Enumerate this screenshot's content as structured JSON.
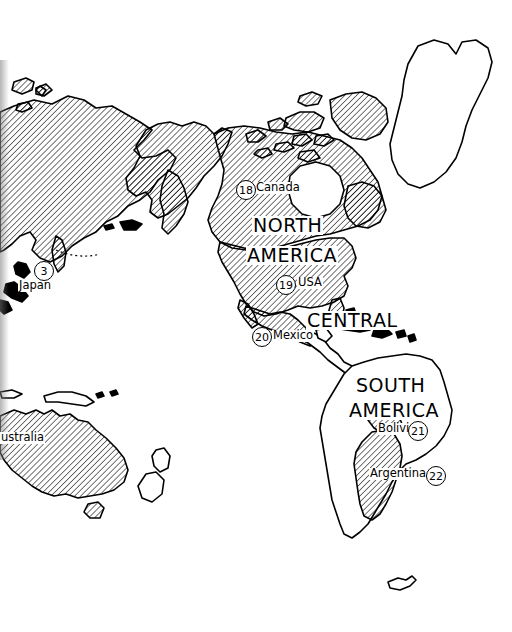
{
  "map": {
    "title": "World Map - Americas",
    "projection_note": "Pacific-centered world map, Americas region",
    "style": {
      "background": "#ffffff",
      "line_color": "#000000",
      "hatch_color": "#000000",
      "hatch_angle_deg": 45,
      "hatch_spacing_px": 3
    },
    "region_labels": [
      {
        "id": "north-america",
        "text": "NORTH",
        "x": 252,
        "y": 216
      },
      {
        "id": "north-america-2",
        "text": "AMERICA",
        "x": 246,
        "y": 246
      },
      {
        "id": "central-america",
        "text": "CENTRAL",
        "x": 306,
        "y": 311
      },
      {
        "id": "south-america",
        "text": "SOUTH",
        "x": 355,
        "y": 376
      },
      {
        "id": "south-america-2",
        "text": "AMERICA",
        "x": 348,
        "y": 401
      }
    ],
    "country_labels": [
      {
        "id": "japan",
        "text": "Japan",
        "x": 18,
        "y": 280
      },
      {
        "id": "australia",
        "text": "ustralia",
        "x": 0,
        "y": 432
      },
      {
        "id": "canada",
        "text": "Canada",
        "x": 255,
        "y": 182
      },
      {
        "id": "usa",
        "text": "USA",
        "x": 297,
        "y": 277
      },
      {
        "id": "mexico",
        "text": "Mexico",
        "x": 272,
        "y": 330
      },
      {
        "id": "bolivia",
        "text": "Bolivia",
        "x": 377,
        "y": 423
      },
      {
        "id": "argentina",
        "text": "Argentina",
        "x": 369,
        "y": 468
      }
    ],
    "markers": [
      {
        "id": "marker-japan",
        "number": "3",
        "country": "Japan",
        "x": 34,
        "y": 261
      },
      {
        "id": "marker-canada",
        "number": "18",
        "country": "Canada",
        "x": 236,
        "y": 180
      },
      {
        "id": "marker-usa",
        "number": "19",
        "country": "USA",
        "x": 276,
        "y": 275
      },
      {
        "id": "marker-mexico",
        "number": "20",
        "country": "Mexico",
        "x": 252,
        "y": 327
      },
      {
        "id": "marker-bolivia",
        "number": "21",
        "country": "Bolivia",
        "x": 408,
        "y": 421
      },
      {
        "id": "marker-argentina",
        "number": "22",
        "country": "Argentina",
        "x": 426,
        "y": 466
      }
    ],
    "highlighted_countries": [
      "Russia",
      "Japan",
      "Australia",
      "Canada",
      "Alaska",
      "United States",
      "Mexico",
      "Bolivia",
      "Argentina"
    ],
    "unhighlighted_landmasses": [
      "Greenland",
      "Central America",
      "Caribbean islands",
      "Brazil",
      "Peru",
      "Chile",
      "New Zealand",
      "Falkland Islands"
    ]
  }
}
